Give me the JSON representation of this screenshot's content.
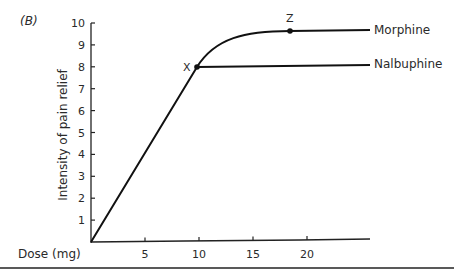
{
  "chart_data": {
    "type": "line",
    "panel_label": "(B)",
    "title": "",
    "xlabel": "Dose (mg)",
    "ylabel": "Intensity of pain relief",
    "xlim": [
      0,
      25
    ],
    "ylim": [
      0,
      10
    ],
    "x_ticks": [
      5,
      10,
      15,
      20
    ],
    "y_ticks": [
      1,
      2,
      3,
      4,
      5,
      6,
      7,
      8,
      9,
      10
    ],
    "grid": false,
    "legend_position": "inline-right",
    "series": [
      {
        "name": "Morphine",
        "x": [
          0,
          10,
          12,
          14,
          16,
          18,
          25
        ],
        "y": [
          0,
          8,
          8.9,
          9.35,
          9.6,
          9.7,
          9.75
        ]
      },
      {
        "name": "Nalbuphine",
        "x": [
          0,
          10,
          25
        ],
        "y": [
          0,
          8,
          8.1
        ]
      }
    ],
    "annotations": [
      {
        "label": "X",
        "x": 10,
        "y": 8
      },
      {
        "label": "Z",
        "x": 18,
        "y": 9.7
      }
    ]
  },
  "labels": {
    "panel": "(B)",
    "xlabel": "Dose (mg)",
    "ylabel": "Intensity of pain relief",
    "morphine": "Morphine",
    "nalbuphine": "Nalbuphine",
    "point_x": "X",
    "point_z": "Z"
  }
}
